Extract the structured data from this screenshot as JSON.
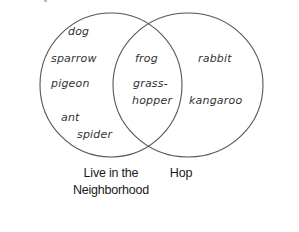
{
  "diagram": {
    "type": "venn",
    "stroke_color": "#555555",
    "sets": [
      {
        "id": "left",
        "label_lines": [
          "Live in the",
          "Neighborhood"
        ],
        "only_items": [
          "dog",
          "sparrow",
          "pigeon",
          "ant",
          "spider"
        ]
      },
      {
        "id": "right",
        "label_lines": [
          "Hop"
        ],
        "only_items": [
          "rabbit",
          "kangaroo"
        ]
      }
    ],
    "intersection_items": [
      "frog",
      "grass-hopper"
    ],
    "intersection_display": {
      "frog": "frog",
      "grass_line1": "grass-",
      "grass_line2": "hopper"
    }
  }
}
